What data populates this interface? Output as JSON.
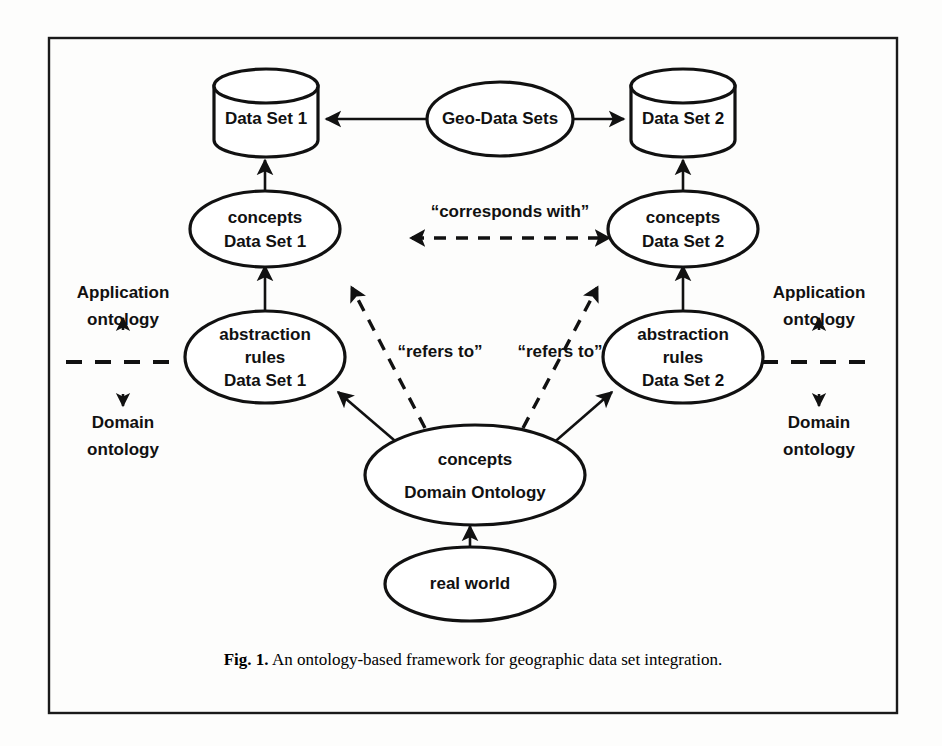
{
  "figure": {
    "caption_prefix": "Fig. 1.",
    "caption_text": " An ontology-based framework for geographic data set integration.",
    "background_color": "#fdfdfc",
    "ink_color": "#111111"
  },
  "nodes": {
    "data_set_1": {
      "label": "Data Set 1",
      "shape": "cylinder"
    },
    "data_set_2": {
      "label": "Data Set 2",
      "shape": "cylinder"
    },
    "geo_data_sets": {
      "label": "Geo-Data Sets",
      "shape": "ellipse"
    },
    "concepts_ds1": {
      "line1": "concepts",
      "line2": "Data Set 1",
      "shape": "ellipse"
    },
    "concepts_ds2": {
      "line1": "concepts",
      "line2": "Data Set  2",
      "shape": "ellipse"
    },
    "abstraction_ds1": {
      "line1": "abstraction",
      "line2": "rules",
      "line3": "Data Set 1",
      "shape": "ellipse"
    },
    "abstraction_ds2": {
      "line1": "abstraction",
      "line2": "rules",
      "line3": "Data Set 2",
      "shape": "ellipse"
    },
    "concepts_domain": {
      "line1": "concepts",
      "line2": "Domain Ontology",
      "shape": "ellipse"
    },
    "real_world": {
      "label": "real world",
      "shape": "ellipse"
    }
  },
  "edge_labels": {
    "corresponds_with": "“corresponds with”",
    "refers_to_left": "“refers to”",
    "refers_to_right": "“refers to”"
  },
  "side_annotations": {
    "left": {
      "upper_line1": "Application",
      "upper_line2": "ontology",
      "lower_line1": "Domain",
      "lower_line2": "ontology"
    },
    "right": {
      "upper_line1": "Application",
      "upper_line2": "ontology",
      "lower_line1": "Domain",
      "lower_line2": "ontology"
    }
  }
}
